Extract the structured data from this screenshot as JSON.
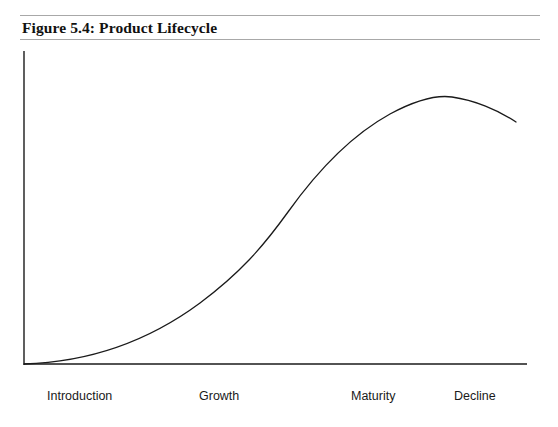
{
  "figure": {
    "title": "Figure 5.4: Product Lifecycle"
  },
  "chart_data": {
    "type": "line",
    "title": "Figure 5.4: Product Lifecycle",
    "xlabel": "",
    "ylabel": "",
    "grid": false,
    "legend": null,
    "axes": {
      "x_axis_visible": true,
      "y_axis_visible": true,
      "x_tick_labels": [
        "Introduction",
        "Growth",
        "Maturity",
        "Decline"
      ],
      "y_tick_labels": [],
      "xlim": [
        0,
        100
      ],
      "ylim": [
        0,
        100
      ]
    },
    "stages": [
      {
        "name": "Introduction",
        "label_x": 47
      },
      {
        "name": "Growth",
        "label_x": 199
      },
      {
        "name": "Maturity",
        "label_x": 351
      },
      {
        "name": "Decline",
        "label_x": 454
      }
    ],
    "series": [
      {
        "name": "Sales",
        "color": "#1a1a1a",
        "x": [
          0,
          5,
          10,
          15,
          20,
          25,
          30,
          35,
          40,
          45,
          50,
          55,
          60,
          65,
          70,
          75,
          80,
          85,
          90,
          95,
          100
        ],
        "y": [
          0,
          1,
          3,
          5,
          8,
          12,
          16,
          21,
          28,
          37,
          48,
          60,
          71,
          80,
          87,
          92,
          95,
          96,
          95,
          92,
          87
        ]
      }
    ],
    "curve_path": "M 24 364 C 90 362 150 340 200 303 C 240 273 262 248 288 212 C 318 170 350 136 390 114 C 418 99 438 95 452 97 C 474 100 498 110 516 122",
    "annotations": []
  }
}
